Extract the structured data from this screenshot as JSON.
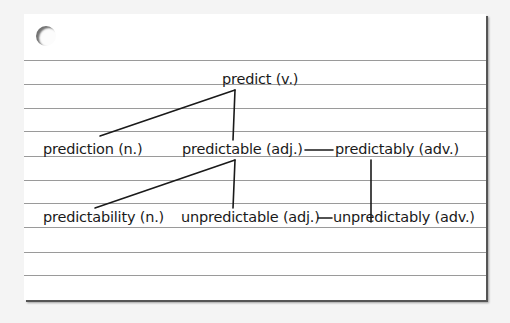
{
  "diagram": {
    "type": "word-family tree on index card",
    "colors": {
      "background": "#f4f4f4",
      "card": "#ffffff",
      "rule": "#9a9a9a",
      "ink": "#1a1a1a"
    },
    "root": {
      "label": "predict (v.)"
    },
    "level1": [
      {
        "label": "prediction (n.)"
      },
      {
        "label": "predictable (adj.)"
      },
      {
        "label": "predictably (adv.)"
      }
    ],
    "level2": [
      {
        "label": "predictability (n.)"
      },
      {
        "label": "unpredictable (adj.)"
      },
      {
        "label": "unpredictably (adv.)"
      }
    ],
    "edges": [
      {
        "from": "predict (v.)",
        "to": "prediction (n.)"
      },
      {
        "from": "predict (v.)",
        "to": "predictable (adj.)"
      },
      {
        "from": "predictable (adj.)",
        "to": "predictably (adv.)"
      },
      {
        "from": "predictable (adj.)",
        "to": "predictability (n.)"
      },
      {
        "from": "predictable (adj.)",
        "to": "unpredictable (adj.)"
      },
      {
        "from": "unpredictable (adj.)",
        "to": "unpredictably (adv.)"
      },
      {
        "from": "predictably (adv.)",
        "to": "unpredictably (adv.)"
      }
    ]
  }
}
